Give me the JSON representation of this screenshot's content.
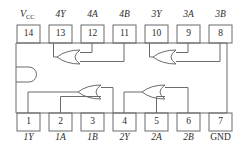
{
  "diagram": {
    "kind": "ic-pinout",
    "package": "14-pin DIP",
    "colors": {
      "line": "#6b6b6b",
      "body_line": "#5a5a5a",
      "text": "#2b2b2b",
      "background": "#ffffff"
    },
    "top_pins": [
      {
        "number": "14",
        "label": "V",
        "label_sub": "CC",
        "is_supply": true
      },
      {
        "number": "13",
        "label": "4Y",
        "label_sub": "",
        "is_supply": false
      },
      {
        "number": "12",
        "label": "4A",
        "label_sub": "",
        "is_supply": false
      },
      {
        "number": "11",
        "label": "4B",
        "label_sub": "",
        "is_supply": false
      },
      {
        "number": "10",
        "label": "3Y",
        "label_sub": "",
        "is_supply": false
      },
      {
        "number": "9",
        "label": "3A",
        "label_sub": "",
        "is_supply": false
      },
      {
        "number": "8",
        "label": "3B",
        "label_sub": "",
        "is_supply": false
      }
    ],
    "bottom_pins": [
      {
        "number": "1",
        "label": "1Y",
        "is_ground": false
      },
      {
        "number": "2",
        "label": "1A",
        "is_ground": false
      },
      {
        "number": "3",
        "label": "1B",
        "is_ground": false
      },
      {
        "number": "4",
        "label": "2Y",
        "is_ground": false
      },
      {
        "number": "5",
        "label": "2A",
        "is_ground": false
      },
      {
        "number": "6",
        "label": "2B",
        "is_ground": false
      },
      {
        "number": "7",
        "label": "GND",
        "is_ground": true
      }
    ],
    "gates": [
      {
        "name": "gate-4",
        "type": "OR",
        "output_pin": "13",
        "input_pins": [
          "12",
          "11"
        ],
        "position": "top-left",
        "orientation": "output-left"
      },
      {
        "name": "gate-3",
        "type": "OR",
        "output_pin": "10",
        "input_pins": [
          "9",
          "8"
        ],
        "position": "top-right",
        "orientation": "output-left"
      },
      {
        "name": "gate-1",
        "type": "OR",
        "output_pin": "1",
        "input_pins": [
          "2",
          "3"
        ],
        "position": "bottom-left",
        "orientation": "output-left"
      },
      {
        "name": "gate-2",
        "type": "OR",
        "output_pin": "4",
        "input_pins": [
          "5",
          "6"
        ],
        "position": "bottom-right",
        "orientation": "output-left"
      }
    ],
    "notch": {
      "name": "pin-1-notch",
      "side": "left",
      "shape": "semicircle"
    }
  }
}
